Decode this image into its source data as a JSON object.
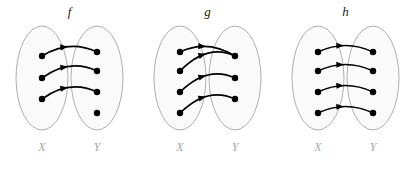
{
  "figure": {
    "background_color": "#ffffff",
    "ellipse_fill": "#fafafa",
    "ellipse_stroke": "#9a9a9a",
    "dot_color": "#000000",
    "arrow_color": "#000000",
    "set_label_color": "#a8a8a8",
    "title_color": "#1a1a1a"
  },
  "panels": [
    {
      "id": "panel-f",
      "title": "f",
      "domain_label": "X",
      "codomain_label": "Y",
      "domain_count": 3,
      "codomain_count": 4,
      "mappings": [
        {
          "from": 0,
          "to": 0
        },
        {
          "from": 1,
          "to": 1
        },
        {
          "from": 2,
          "to": 2
        }
      ]
    },
    {
      "id": "panel-g",
      "title": "g",
      "domain_label": "X",
      "codomain_label": "Y",
      "domain_count": 4,
      "codomain_count": 3,
      "mappings": [
        {
          "from": 0,
          "to": 0
        },
        {
          "from": 1,
          "to": 0
        },
        {
          "from": 2,
          "to": 1
        },
        {
          "from": 3,
          "to": 2
        }
      ]
    },
    {
      "id": "panel-h",
      "title": "h",
      "domain_label": "X",
      "codomain_label": "Y",
      "domain_count": 4,
      "codomain_count": 4,
      "mappings": [
        {
          "from": 0,
          "to": 0
        },
        {
          "from": 1,
          "to": 1
        },
        {
          "from": 2,
          "to": 2
        },
        {
          "from": 3,
          "to": 3
        }
      ]
    }
  ],
  "geometry": {
    "panel_origins": [
      0,
      138,
      276
    ],
    "panel_width": 138,
    "ellipse_rx": 26,
    "ellipse_ry": 52,
    "ellipse_cy": 78,
    "domain_cx": 42,
    "codomain_cx": 97,
    "dot_radius": 3.2,
    "title_y": 16,
    "set_label_y": 151,
    "row_ys_three": [
      56,
      78,
      99
    ],
    "row_ys_four": [
      52,
      71,
      92,
      113
    ]
  }
}
